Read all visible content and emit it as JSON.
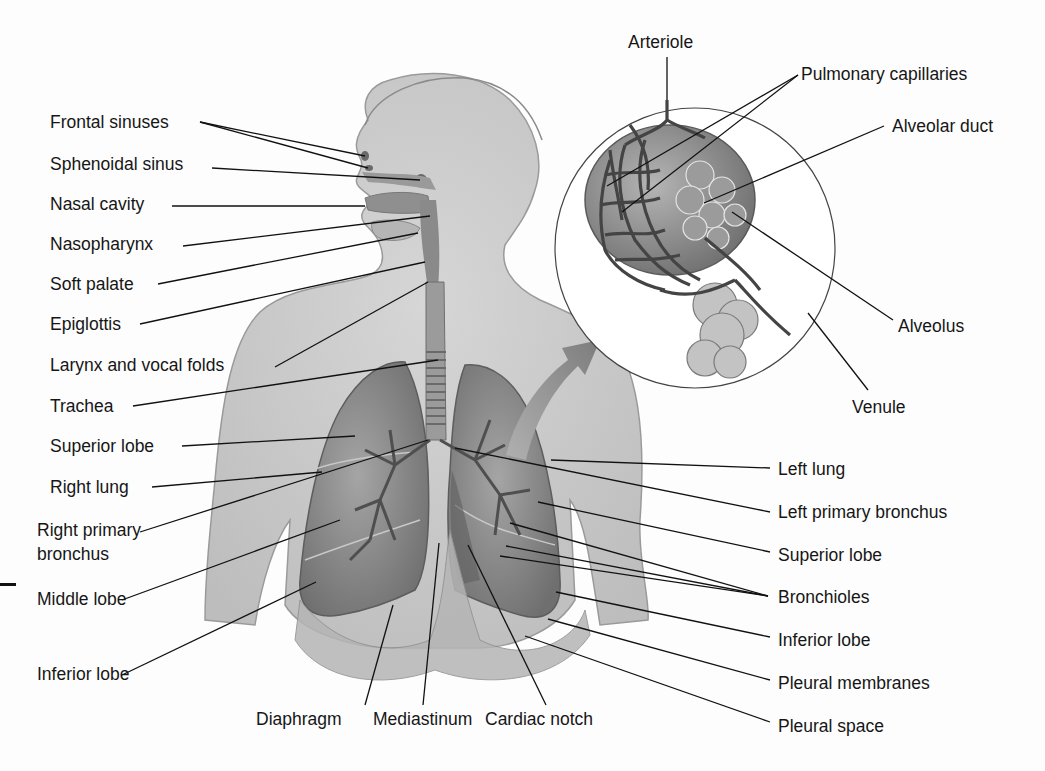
{
  "diagram": {
    "inset": {
      "description": "Magnified view of alveoli with capillary network",
      "labels": {
        "arteriole": "Arteriole",
        "pulmonary_capillaries": "Pulmonary capillaries",
        "alveolar_duct": "Alveolar duct",
        "alveolus": "Alveolus",
        "venule": "Venule"
      }
    },
    "left_labels": {
      "frontal_sinuses": "Frontal sinuses",
      "sphenoidal_sinus": "Sphenoidal sinus",
      "nasal_cavity": "Nasal cavity",
      "nasopharynx": "Nasopharynx",
      "soft_palate": "Soft palate",
      "epiglottis": "Epiglottis",
      "larynx_vocal_folds": "Larynx and vocal folds",
      "trachea": "Trachea",
      "superior_lobe": "Superior lobe",
      "right_lung": "Right lung",
      "right_primary_bronchus": "Right primary bronchus",
      "middle_lobe": "Middle lobe",
      "inferior_lobe": "Inferior lobe"
    },
    "bottom_labels": {
      "diaphragm": "Diaphragm",
      "mediastinum": "Mediastinum",
      "cardiac_notch": "Cardiac notch"
    },
    "right_labels": {
      "left_lung": "Left lung",
      "left_primary_bronchus": "Left primary bronchus",
      "superior_lobe": "Superior lobe",
      "bronchioles": "Bronchioles",
      "inferior_lobe": "Inferior lobe",
      "pleural_membranes": "Pleural membranes",
      "pleural_space": "Pleural space"
    },
    "colors": {
      "body_fill": "#c9c9c9",
      "body_shadow": "#a9a9a9",
      "lung_fill": "#8c8c8c",
      "airway_fill": "#7a7a7a",
      "capillary_fill": "#555555",
      "arrow_fill": "#8a8a8a",
      "leader_line": "#111111",
      "label_text": "#161616"
    }
  }
}
